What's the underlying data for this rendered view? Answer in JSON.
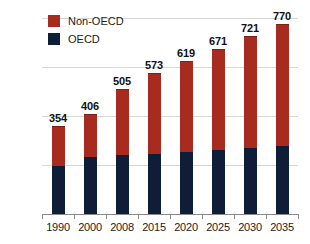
{
  "chart_data": {
    "type": "bar",
    "title": "",
    "subtitle": "",
    "xlabel": "",
    "ylabel": "",
    "stacked": true,
    "grid": true,
    "legend_position": "top-left",
    "categories": [
      "1990",
      "2000",
      "2008",
      "2015",
      "2020",
      "2025",
      "2030",
      "2035"
    ],
    "totals": [
      354,
      406,
      505,
      573,
      619,
      671,
      721,
      770
    ],
    "ylim": [
      0,
      800
    ],
    "yticks": [
      0,
      200,
      400,
      600,
      800
    ],
    "ytick_labels": [
      "0",
      "200",
      "400",
      "600",
      "800"
    ],
    "series": [
      {
        "name": "OECD",
        "color": "#0f1e38",
        "values": [
          195,
          232,
          240,
          247,
          252,
          262,
          270,
          277
        ]
      },
      {
        "name": "Non-OECD",
        "color": "#a82b20",
        "values": [
          159,
          174,
          265,
          326,
          367,
          409,
          451,
          493
        ]
      }
    ],
    "data_labels": [
      "354",
      "406",
      "505",
      "573",
      "619",
      "671",
      "721",
      "770"
    ]
  },
  "legend": {
    "items": [
      {
        "label": "Non-OECD",
        "color": "#a82b20"
      },
      {
        "label": "OECD",
        "color": "#0f1e38"
      }
    ]
  },
  "colors": {
    "non_oecd": "#a82b20",
    "oecd": "#0f1e38",
    "gridline": "#d7d7d7",
    "axis": "#8a8a8a",
    "background": "#ffffff",
    "text": "#222222"
  }
}
